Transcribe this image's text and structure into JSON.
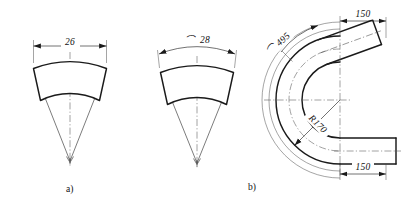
{
  "drawing": {
    "title": "Pipe bend development and bend geometry",
    "background_color": "#ffffff",
    "line_color": "#1a1a1a",
    "figures": [
      {
        "id": "figure-a",
        "caption": "a)",
        "description": "Annular sector flat pattern with linear chord width dimension",
        "dimensions": [
          {
            "name": "chord-width",
            "label": "26",
            "type": "linear",
            "symbol": ""
          }
        ]
      },
      {
        "id": "figure-b",
        "caption": "b)",
        "description": "Annular sector flat pattern with arc length dimension",
        "dimensions": [
          {
            "name": "arc-width",
            "label": "28",
            "type": "arc",
            "symbol": "⌒"
          }
        ]
      },
      {
        "id": "figure-c",
        "caption": "",
        "description": "180 degree pipe bend elevation with bend radius, arc length and tangent lengths",
        "dimensions": [
          {
            "name": "arc-length",
            "label": "495",
            "type": "arc",
            "symbol": "⌒"
          },
          {
            "name": "bend-radius",
            "label": "R170",
            "type": "radius",
            "symbol": ""
          },
          {
            "name": "tangent-top",
            "label": "150",
            "type": "linear",
            "symbol": ""
          },
          {
            "name": "tangent-bottom",
            "label": "150",
            "type": "linear",
            "symbol": ""
          }
        ]
      }
    ],
    "labels": {
      "dim_26": "26",
      "dim_28": "28",
      "arc_symbol": "⌒",
      "dim_495": "495",
      "dim_r170": "R170",
      "dim_150_top": "150",
      "dim_150_bottom": "150",
      "caption_a": "a)",
      "caption_b": "b)"
    }
  }
}
